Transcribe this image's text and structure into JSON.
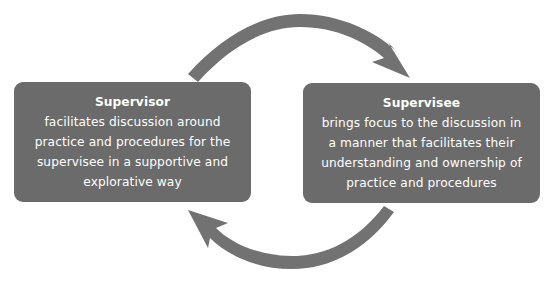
{
  "diagram": {
    "type": "cycle",
    "colors": {
      "box_fill": "#6b6b6b",
      "arrow_fill": "#727272",
      "text": "#ffffff",
      "background": "#ffffff"
    },
    "nodes": [
      {
        "title": "Supervisor",
        "lines": [
          "facilitates discussion around",
          "practice and procedures for the",
          "supervisee in a supportive and",
          "explorative way"
        ]
      },
      {
        "title": "Supervisee",
        "lines": [
          "brings focus to the discussion in",
          "a manner that facilitates their",
          "understanding and ownership of",
          "practice and procedures"
        ]
      }
    ],
    "edges": [
      {
        "from": "Supervisor",
        "to": "Supervisee",
        "icon": "curved-arrow-top-right"
      },
      {
        "from": "Supervisee",
        "to": "Supervisor",
        "icon": "curved-arrow-bottom-left"
      }
    ]
  }
}
